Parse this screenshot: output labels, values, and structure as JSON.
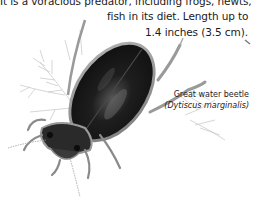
{
  "description": {
    "lines": [
      "It is a voracious predator, including frogs, newts, and small",
      "fish in its diet. Length up to",
      "1.4 inches (3.5 cm)."
    ]
  },
  "caption": {
    "common_name": "Great water beetle",
    "scientific_name": "(Dytiscus marginalis)"
  },
  "illustration": {
    "subject": "great-water-beetle",
    "colors": {
      "shell": "#161616",
      "highlight": "#8a8a8a",
      "rim": "#9a9a9a",
      "plant": "#b8b8b8"
    }
  }
}
